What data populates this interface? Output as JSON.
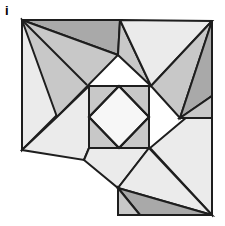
{
  "figure": {
    "panel_label": "i",
    "background_color": "#ffffff",
    "outline_color": "#1e1e1e",
    "outline_width": 2,
    "palette": {
      "light": "#ebebeb",
      "medium": "#c8c8c8",
      "dark": "#a9a9a9",
      "white": "#f7f7f7"
    },
    "canvas": {
      "width": 225,
      "height": 226
    },
    "anchors": {
      "top_left": [
        22,
        20
      ],
      "top_right": [
        212,
        21
      ],
      "bottom_right": [
        212,
        215
      ],
      "left_low": [
        22,
        150
      ],
      "bottom_apex": [
        118,
        188
      ],
      "bottom_low_left": [
        84,
        160
      ],
      "inner_square_tl": [
        89,
        86
      ],
      "inner_square_br": [
        149,
        148
      ]
    },
    "pieces": [
      {
        "name": "top-left-light-triangle",
        "tone": "light",
        "points": "22,20 22,150 87,85"
      },
      {
        "name": "top-dark-wedge",
        "tone": "dark",
        "points": "22,20 118,55 120,20"
      },
      {
        "name": "top-upper-medium-triangle",
        "tone": "medium",
        "points": "22,20 118,55 57,117"
      },
      {
        "name": "top-band-medium",
        "tone": "medium",
        "points": "120,20 118,55 151,86"
      },
      {
        "name": "top-right-light-triangle",
        "tone": "light",
        "points": "120,20 212,21 151,86"
      },
      {
        "name": "right-upper-medium",
        "tone": "medium",
        "points": "151,86 212,21 180,118"
      },
      {
        "name": "right-dark-wedge",
        "tone": "dark",
        "points": "212,21 212,96 180,118"
      },
      {
        "name": "right-lower-light",
        "tone": "light",
        "points": "212,96 212,215 150,148"
      },
      {
        "name": "mid-left-light-strip",
        "tone": "light",
        "points": "22,150 57,117 89,86 89,148 84,160"
      },
      {
        "name": "center-square-medium",
        "tone": "medium",
        "points": "89,86 149,86 149,148 89,148"
      },
      {
        "name": "center-diamond-white",
        "tone": "white",
        "points": "119,86 149,117 119,148 89,117"
      },
      {
        "name": "lower-left-light-triangle",
        "tone": "light",
        "points": "84,160 89,148 149,148 118,188"
      },
      {
        "name": "bottom-right-light-triangle",
        "tone": "light",
        "points": "149,148 212,215 118,188"
      },
      {
        "name": "bottom-dark-triangle",
        "tone": "dark",
        "points": "118,188 212,215 140,215"
      },
      {
        "name": "bottom-medium-sliver",
        "tone": "medium",
        "points": "118,188 140,215 118,215"
      },
      {
        "name": "right-wedge-medium-lower",
        "tone": "medium",
        "points": "180,118 212,96 212,118"
      }
    ],
    "inner_lines": [
      {
        "name": "diagonal-top-left-to-center",
        "points": "22,20 87,85"
      },
      {
        "name": "center-square-outline",
        "points": "89,86 149,86 149,148 89,148 89,86"
      },
      {
        "name": "diamond-outline",
        "points": "119,86 149,117 119,148 89,117 119,86"
      }
    ]
  }
}
